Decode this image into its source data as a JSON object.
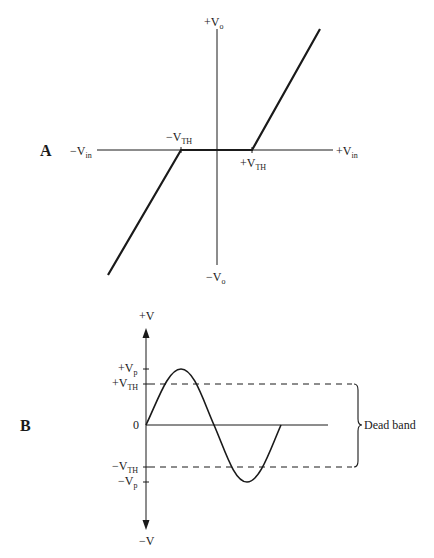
{
  "panel_a": {
    "label": "A",
    "axis_labels": {
      "x_neg": {
        "main": "−V",
        "sub": "in"
      },
      "x_pos": {
        "main": "+V",
        "sub": "in"
      },
      "y_pos": {
        "main": "+V",
        "sub": "o"
      },
      "y_neg": {
        "main": "−V",
        "sub": "o"
      }
    },
    "threshold_labels": {
      "neg": {
        "main": "−V",
        "sub": "TH"
      },
      "pos": {
        "main": "+V",
        "sub": "TH"
      }
    },
    "description": "Transfer characteristic with dead zone between -VTH and +VTH"
  },
  "panel_b": {
    "label": "B",
    "axis_labels": {
      "top": "+V",
      "bottom": "−V",
      "zero": "0"
    },
    "level_labels": {
      "pos_peak": {
        "main": "+V",
        "sub": "p"
      },
      "pos_th": {
        "main": "+V",
        "sub": "TH"
      },
      "neg_th": {
        "main": "−V",
        "sub": "TH"
      },
      "neg_peak": {
        "main": "−V",
        "sub": "p"
      }
    },
    "brace_label": "Dead band",
    "description": "One cycle of sine wave with dashed threshold lines; region between thresholds marked as dead band"
  },
  "colors": {
    "ink": "#1a1a1a",
    "background": "#ffffff"
  }
}
